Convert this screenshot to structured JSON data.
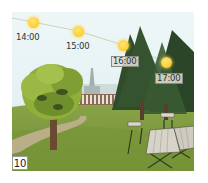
{
  "figure": {
    "number_badge": "10",
    "sun_positions": [
      {
        "time": "14:00",
        "x": 33,
        "y": 22,
        "label_x": 16,
        "label_y": 33,
        "boxed": false
      },
      {
        "time": "15:00",
        "x": 78,
        "y": 31,
        "label_x": 66,
        "label_y": 42,
        "boxed": false
      },
      {
        "time": "16:00",
        "x": 123,
        "y": 45,
        "label_x": 111,
        "label_y": 56,
        "boxed": true
      },
      {
        "time": "17:00",
        "x": 166,
        "y": 62,
        "label_x": 155,
        "label_y": 73,
        "boxed": true
      }
    ],
    "colors": {
      "sky": "#e6f2f4",
      "grass": "#7d9a3e",
      "grass_dark": "#5f7a2c",
      "path": "#b5ab86",
      "conifer": "#2e4a2a",
      "deciduous": "#8fae3a",
      "sun": "#ffd23a",
      "sun_path_line": "#c9c9a8"
    }
  }
}
